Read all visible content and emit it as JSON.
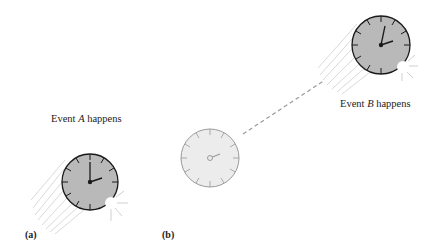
{
  "labels": {
    "event_a_prefix": "Event ",
    "event_a_var": "A",
    "event_a_suffix": " happens",
    "event_b_prefix": "Event ",
    "event_b_var": "B",
    "event_b_suffix": " happens",
    "panel_a": "(a)",
    "panel_b": "(b)"
  },
  "colors": {
    "clock_face_dark": "#b9b9b9",
    "clock_face_light": "#ececec",
    "outline_dark": "#1a1a1a",
    "outline_light": "#9a9a9a",
    "dash_line": "#9a9a9a"
  }
}
